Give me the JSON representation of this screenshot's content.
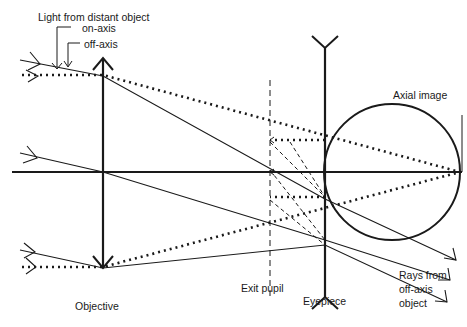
{
  "labels": {
    "light_source": "Light from distant object",
    "on_axis": "on-axis",
    "off_axis": "off-axis",
    "axial_image": "Axial image",
    "objective": "Objective",
    "exit_pupil": "Exit pupil",
    "eyepiece": "Eyepiece",
    "rays_line1": "Rays from",
    "rays_line2": "off-axis",
    "rays_line3": "object"
  },
  "colors": {
    "ink": "#1a1a1a",
    "background": "#ffffff"
  }
}
